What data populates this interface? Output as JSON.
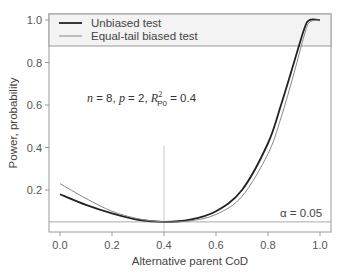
{
  "chart_data": {
    "type": "line",
    "title": "",
    "xlabel": "Alternative parent CoD",
    "ylabel": "Power, probability",
    "xlim": [
      0,
      1
    ],
    "ylim": [
      0.05,
      1.0
    ],
    "xticks": [
      "0.0",
      "0.2",
      "0.4",
      "0.6",
      "0.8",
      "1.0"
    ],
    "yticks": [
      "0.2",
      "0.4",
      "0.6",
      "0.8",
      "1.0"
    ],
    "legend": {
      "position": "top-left",
      "entries": [
        "Unbiased test",
        "Equal-tail biased test"
      ]
    },
    "annotation": "n = 8, p = 2, R²_P0 = 0.4",
    "alpha_label": "α = 0.05",
    "alpha": 0.05,
    "reference_x": 0.4,
    "x": [
      0.0,
      0.1,
      0.2,
      0.3,
      0.4,
      0.5,
      0.6,
      0.7,
      0.8,
      0.85,
      0.9,
      0.94,
      0.96,
      1.0
    ],
    "series": [
      {
        "name": "Unbiased test",
        "values": [
          0.18,
          0.13,
          0.09,
          0.06,
          0.05,
          0.06,
          0.1,
          0.2,
          0.42,
          0.6,
          0.8,
          0.96,
          1.0,
          1.0
        ]
      },
      {
        "name": "Equal-tail biased test",
        "values": [
          0.23,
          0.16,
          0.1,
          0.065,
          0.05,
          0.055,
          0.085,
          0.17,
          0.37,
          0.54,
          0.75,
          0.93,
          0.99,
          1.0
        ]
      }
    ]
  },
  "labels": {
    "legend_unbiased": "Unbiased test",
    "legend_biased": "Equal-tail biased test",
    "xlabel": "Alternative parent CoD",
    "ylabel": "Power, probability",
    "alpha": "α = 0.05"
  }
}
